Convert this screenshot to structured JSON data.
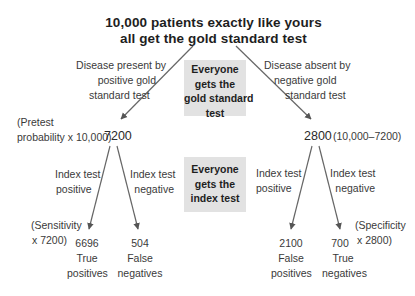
{
  "title": {
    "line1": "10,000 patients exactly like yours",
    "line2": "all get the gold standard test"
  },
  "gold_standard_box": {
    "lines": [
      "Everyone",
      "gets the",
      "gold standard",
      "test"
    ]
  },
  "index_test_box": {
    "lines": [
      "Everyone",
      "gets the",
      "index test"
    ]
  },
  "left_branch": {
    "label_lines": [
      "Disease present by",
      "positive gold",
      "standard test"
    ],
    "note_lines": [
      "(Pretest",
      "probability x 10,000)"
    ],
    "count": "7200",
    "positive_label_lines": [
      "Index test",
      "positive"
    ],
    "negative_label_lines": [
      "Index test",
      "negative"
    ],
    "sensitivity_note_lines": [
      "(Sensitivity",
      "x 7200)"
    ],
    "outcomes": [
      {
        "value": "6696",
        "label_lines": [
          "True",
          "positives"
        ]
      },
      {
        "value": "504",
        "label_lines": [
          "False",
          "negatives"
        ]
      }
    ]
  },
  "right_branch": {
    "label_lines": [
      "Disease absent by",
      "negative gold",
      "standard test"
    ],
    "note": "(10,000–7200)",
    "count": "2800",
    "positive_label_lines": [
      "Index test",
      "positive"
    ],
    "negative_label_lines": [
      "Index test",
      "negative"
    ],
    "specificity_note_lines": [
      "(Specificity",
      "x 2800)"
    ],
    "outcomes": [
      {
        "value": "2100",
        "label_lines": [
          "False",
          "positives"
        ]
      },
      {
        "value": "700",
        "label_lines": [
          "True",
          "negatives"
        ]
      }
    ]
  },
  "colors": {
    "arrow": "#555555",
    "box_fill": "#e2e2e2",
    "text": "#2a2a2a"
  }
}
